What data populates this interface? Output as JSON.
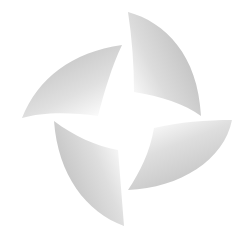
{
  "image": {
    "subject": "four-petal pinwheel logo",
    "background": "#ffffff",
    "petal_dark": "#c4c4c4",
    "petal_light": "#ffffff",
    "petals": [
      {
        "name": "top-right",
        "position": "upper right"
      },
      {
        "name": "top-left",
        "position": "upper left"
      },
      {
        "name": "bottom-left",
        "position": "lower left"
      },
      {
        "name": "bottom-right",
        "position": "lower right"
      }
    ]
  }
}
